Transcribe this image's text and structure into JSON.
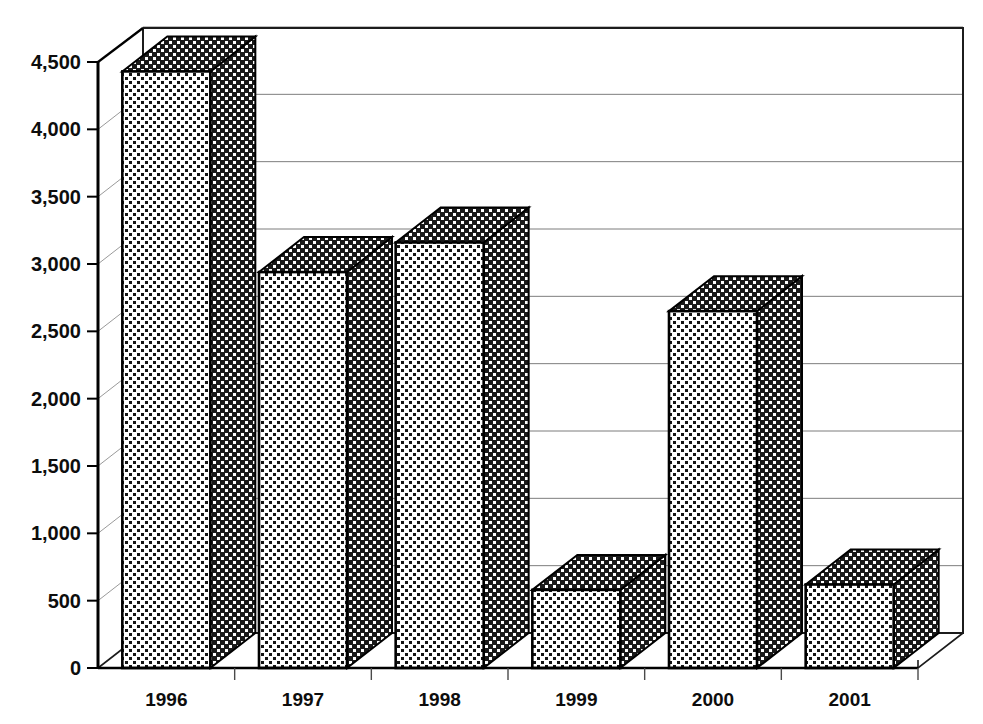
{
  "chart_data": {
    "type": "bar",
    "title": "",
    "subtitle": "",
    "xlabel": "",
    "ylabel": "",
    "categories": [
      "1996",
      "1997",
      "1998",
      "1999",
      "2000",
      "2001"
    ],
    "values": [
      4430,
      2940,
      3160,
      580,
      2650,
      620
    ],
    "series": [
      {
        "name": "",
        "values": [
          4430,
          2940,
          3160,
          580,
          2650,
          620
        ]
      }
    ],
    "ylim": [
      0,
      4500
    ],
    "ytick_values": [
      0,
      500,
      1000,
      1500,
      2000,
      2500,
      3000,
      3500,
      4000,
      4500
    ],
    "ytick_labels": [
      "0",
      "500",
      "1,000",
      "1,500",
      "2,000",
      "2,500",
      "3,000",
      "3,500",
      "4,000",
      "4,500"
    ],
    "grid": true,
    "grid_axis": "y",
    "legend": false,
    "legend_position": "none",
    "style": {
      "three_d": true,
      "bar_fill": "dotted-pattern",
      "bar_front_color": "#ffffff",
      "bar_dot_color": "#111111",
      "bar_side_color": "#1a1a1a",
      "outline_color": "#000000",
      "grid_color": "#7d7d7d",
      "axis_color": "#000000",
      "background": "#ffffff",
      "text_color": "#0d0d0d"
    }
  },
  "axes": {
    "y_axis_name": "value-axis",
    "x_axis_name": "category-axis"
  }
}
